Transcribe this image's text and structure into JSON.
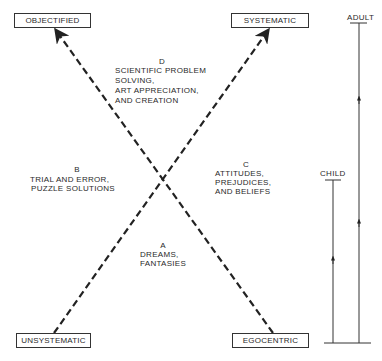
{
  "diagram": {
    "type": "crossed-axes developmental diagram",
    "corner_boxes": {
      "top_left": "OBJECTIFIED",
      "top_right": "SYSTEMATIC",
      "bottom_left": "UNSYSTEMATIC",
      "bottom_right": "EGOCENTRIC"
    },
    "quadrants": {
      "top": {
        "letter": "D",
        "lines": [
          "SCIENTIFIC PROBLEM",
          "SOLVING,",
          "ART APPRECIATION,",
          "AND CREATION"
        ]
      },
      "left": {
        "letter": "B",
        "lines": [
          "TRIAL AND ERROR,",
          "PUZZLE SOLUTIONS"
        ]
      },
      "right": {
        "letter": "C",
        "lines": [
          "ATTITUDES,",
          "PREJUDICES,",
          "AND BELIEFS"
        ]
      },
      "bottom": {
        "letter": "A",
        "lines": [
          "DREAMS,",
          "FANTASIES"
        ]
      }
    },
    "development_scale": {
      "adult_label": "ADULT",
      "child_label": "CHILD"
    },
    "line_color": "#222222",
    "edges": [
      {
        "from": "UNSYSTEMATIC",
        "to": "SYSTEMATIC",
        "style": "dashed",
        "arrow": "end"
      },
      {
        "from": "EGOCENTRIC",
        "to": "OBJECTIFIED",
        "style": "dashed",
        "arrow": "end"
      }
    ]
  }
}
